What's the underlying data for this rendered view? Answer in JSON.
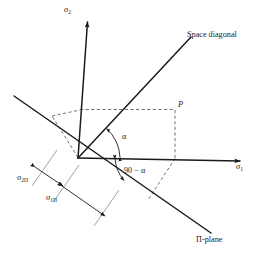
{
  "figure": {
    "background_color": "#ffffff",
    "line_color": "#1a1a1a",
    "dashed_color": "#555555",
    "width": 259,
    "height": 259
  },
  "axes": {
    "sigma2": {
      "label": "σ",
      "subscript": "2",
      "name": "sigma-2-axis",
      "direction": "vertical-up"
    },
    "sigma1": {
      "label": "σ",
      "subscript": "1",
      "name": "sigma-1-axis",
      "direction": "horizontal-right"
    }
  },
  "lines": {
    "space_diagonal": {
      "label": "Space diagonal"
    },
    "pi_plane": {
      "label": "Π-plane"
    }
  },
  "points": {
    "p": {
      "label": "P"
    }
  },
  "angles": {
    "alpha": {
      "label": "α"
    },
    "complement": {
      "label": "90 − α"
    }
  },
  "dimensions": {
    "sigma_2pi": {
      "label": "σ",
      "subscript": "2Π"
    },
    "sigma_1pi": {
      "label": "σ",
      "subscript": "1Π"
    }
  }
}
